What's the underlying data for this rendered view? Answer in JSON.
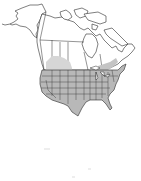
{
  "map": {
    "type": "range-map",
    "region": "North America",
    "colors": {
      "background": "#ffffff",
      "range_fill": "#b8b8b8",
      "range_fill_light": "#d6d6d6",
      "outside_fill": "#ffffff",
      "border": "#2a2a2a"
    },
    "shaded_regions": [
      "Contiguous United States",
      "Southern Canadian prairies (partial)",
      "Southern Ontario/Quebec (partial)"
    ],
    "unshaded_regions": [
      "Alaska",
      "Northern Canada",
      "Greenland edge",
      "Mexico (not drawn)"
    ]
  }
}
